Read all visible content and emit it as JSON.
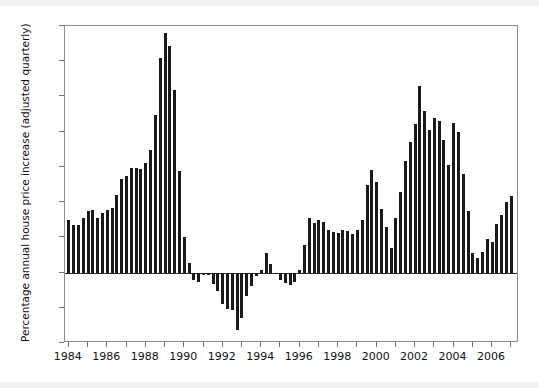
{
  "figure": {
    "background_color": "#ffffff",
    "bar_color": "#1a1a1a",
    "axis_color": "#8c8c8c"
  },
  "chart_data": {
    "type": "bar",
    "title": "",
    "subtitle": "",
    "xlabel": "",
    "ylabel": "Percentage annual house price increase (adjusted quarterly)",
    "xlim": [
      1983.8,
      2007.4
    ],
    "ylim": [
      -10,
      35
    ],
    "ytick_labels": [
      "35",
      "30",
      "25",
      "20",
      "15",
      "10",
      "5",
      "0",
      "-5",
      "-10"
    ],
    "ytick_values": [
      35,
      30,
      25,
      20,
      15,
      10,
      5,
      0,
      -5,
      -10
    ],
    "xtick_labels": [
      "1984",
      "1986",
      "1988",
      "1990",
      "1992",
      "1994",
      "1996",
      "1998",
      "2000",
      "2002",
      "2004",
      "2006"
    ],
    "xtick_values": [
      1984,
      1986,
      1988,
      1990,
      1992,
      1994,
      1996,
      1998,
      2000,
      2002,
      2004,
      2006
    ],
    "xtick_minor_values": [
      1985,
      1987,
      1989,
      1991,
      1993,
      1995,
      1997,
      1999,
      2001,
      2003,
      2005,
      2007
    ],
    "grid": false,
    "legend": null,
    "series_name": "Percentage annual house price increase",
    "x": [
      1984.0,
      1984.25,
      1984.5,
      1984.75,
      1985.0,
      1985.25,
      1985.5,
      1985.75,
      1986.0,
      1986.25,
      1986.5,
      1986.75,
      1987.0,
      1987.25,
      1987.5,
      1987.75,
      1988.0,
      1988.25,
      1988.5,
      1988.75,
      1989.0,
      1989.25,
      1989.5,
      1989.75,
      1990.0,
      1990.25,
      1990.5,
      1990.75,
      1991.0,
      1991.25,
      1991.5,
      1991.75,
      1992.0,
      1992.25,
      1992.5,
      1992.75,
      1993.0,
      1993.25,
      1993.5,
      1993.75,
      1994.0,
      1994.25,
      1994.5,
      1994.75,
      1995.0,
      1995.25,
      1995.5,
      1995.75,
      1996.0,
      1996.25,
      1996.5,
      1996.75,
      1997.0,
      1997.25,
      1997.5,
      1997.75,
      1998.0,
      1998.25,
      1998.5,
      1998.75,
      1999.0,
      1999.25,
      1999.5,
      1999.75,
      2000.0,
      2000.25,
      2000.5,
      2000.75,
      2001.0,
      2001.25,
      2001.5,
      2001.75,
      2002.0,
      2002.25,
      2002.5,
      2002.75,
      2003.0,
      2003.25,
      2003.5,
      2003.75,
      2004.0,
      2004.25,
      2004.5,
      2004.75,
      2005.0,
      2005.25,
      2005.5,
      2005.75,
      2006.0,
      2006.25,
      2006.5,
      2006.75,
      2007.0
    ],
    "values": [
      7.4,
      6.7,
      6.8,
      7.7,
      8.8,
      8.9,
      7.8,
      8.5,
      8.9,
      9.2,
      11.0,
      13.3,
      13.7,
      14.9,
      14.8,
      14.7,
      15.6,
      17.4,
      22.4,
      30.4,
      34.0,
      32.2,
      25.9,
      14.4,
      5.1,
      1.4,
      -1.0,
      -1.3,
      -0.3,
      -0.3,
      -1.6,
      -2.6,
      -4.4,
      -5.2,
      -5.3,
      -8.2,
      -6.4,
      -3.4,
      -1.9,
      -0.5,
      0.4,
      2.8,
      1.2,
      -0.2,
      -1.0,
      -1.5,
      -1.8,
      -1.3,
      0.3,
      3.9,
      7.7,
      7.0,
      7.5,
      7.2,
      6.1,
      5.8,
      5.6,
      6.0,
      5.9,
      5.5,
      6.0,
      7.5,
      12.5,
      14.5,
      12.8,
      9.0,
      6.5,
      3.5,
      7.8,
      11.4,
      15.8,
      18.6,
      21.1,
      26.5,
      23.0,
      20.2,
      22.0,
      21.5,
      18.8,
      15.3,
      21.2,
      20.0,
      14.0,
      8.8,
      2.8,
      2.0,
      2.9,
      4.8,
      4.3,
      6.9,
      8.2,
      10.0,
      10.8
    ]
  }
}
